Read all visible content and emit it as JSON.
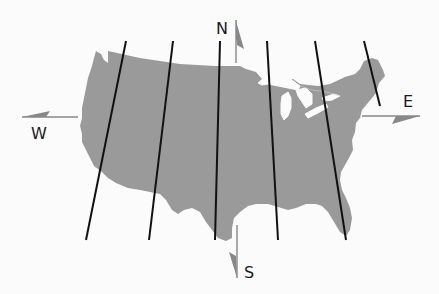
{
  "map": {
    "subject": "Contiguous United States",
    "land_color": "#9a9a9a",
    "water_color": "#fbfbfb",
    "line_color": "#111111",
    "arrow_color": "#888888",
    "meridian_lines": [
      {
        "x1": 126,
        "y1": 41,
        "x2": 86,
        "y2": 240
      },
      {
        "x1": 173,
        "y1": 41,
        "x2": 149,
        "y2": 240
      },
      {
        "x1": 220,
        "y1": 41,
        "x2": 215,
        "y2": 240
      },
      {
        "x1": 267,
        "y1": 41,
        "x2": 278,
        "y2": 240
      },
      {
        "x1": 315,
        "y1": 41,
        "x2": 346,
        "y2": 240
      },
      {
        "x1": 364,
        "y1": 41,
        "x2": 380,
        "y2": 106
      }
    ]
  },
  "compass": {
    "north_label": "N",
    "south_label": "S",
    "east_label": "E",
    "west_label": "W"
  }
}
